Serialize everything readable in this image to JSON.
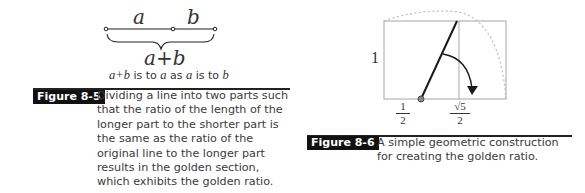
{
  "figure_8_5": {
    "diagram": {
      "segment_a_label": "a",
      "segment_b_label": "b",
      "sum_label": "a+b",
      "relation": {
        "part1": "a+b",
        "text1": " is to ",
        "part2": "a",
        "text2": " as ",
        "part3": "a",
        "text3": " is to ",
        "part4": "b"
      }
    },
    "label": "Figure 8-5",
    "caption": "Dividing a line into two parts such that the ratio of the length of the longer part to the shorter part is the same as the ratio of the original line to the longer part results in the golden section, which exhibits the golden ratio."
  },
  "figure_8_6": {
    "diagram": {
      "side_label": "1",
      "half_numerator": "1",
      "half_denominator": "2",
      "root_numerator": "√5",
      "root_denominator": "2"
    },
    "label": "Figure 8-6",
    "caption": "A simple geometric construction for creating the golden ratio."
  },
  "colors": {
    "label_bg": "#111111",
    "label_text": "#ffffff",
    "rect_stroke": "#b5b5b5",
    "arc_dotted": "#bdbdbd",
    "line_dark": "#1a1a1a"
  }
}
